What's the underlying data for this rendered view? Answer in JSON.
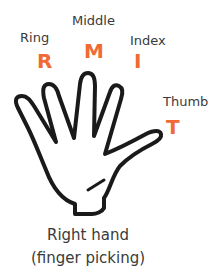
{
  "diagram": {
    "accent_color": "#f06a35",
    "text_color": "#3a3a3a",
    "fingers": [
      {
        "name": "Ring",
        "letter": "R"
      },
      {
        "name": "Middle",
        "letter": "M"
      },
      {
        "name": "Index",
        "letter": "I"
      },
      {
        "name": "Thumb",
        "letter": "T"
      }
    ],
    "caption": {
      "line1": "Right hand",
      "line2": "(finger picking)"
    }
  }
}
